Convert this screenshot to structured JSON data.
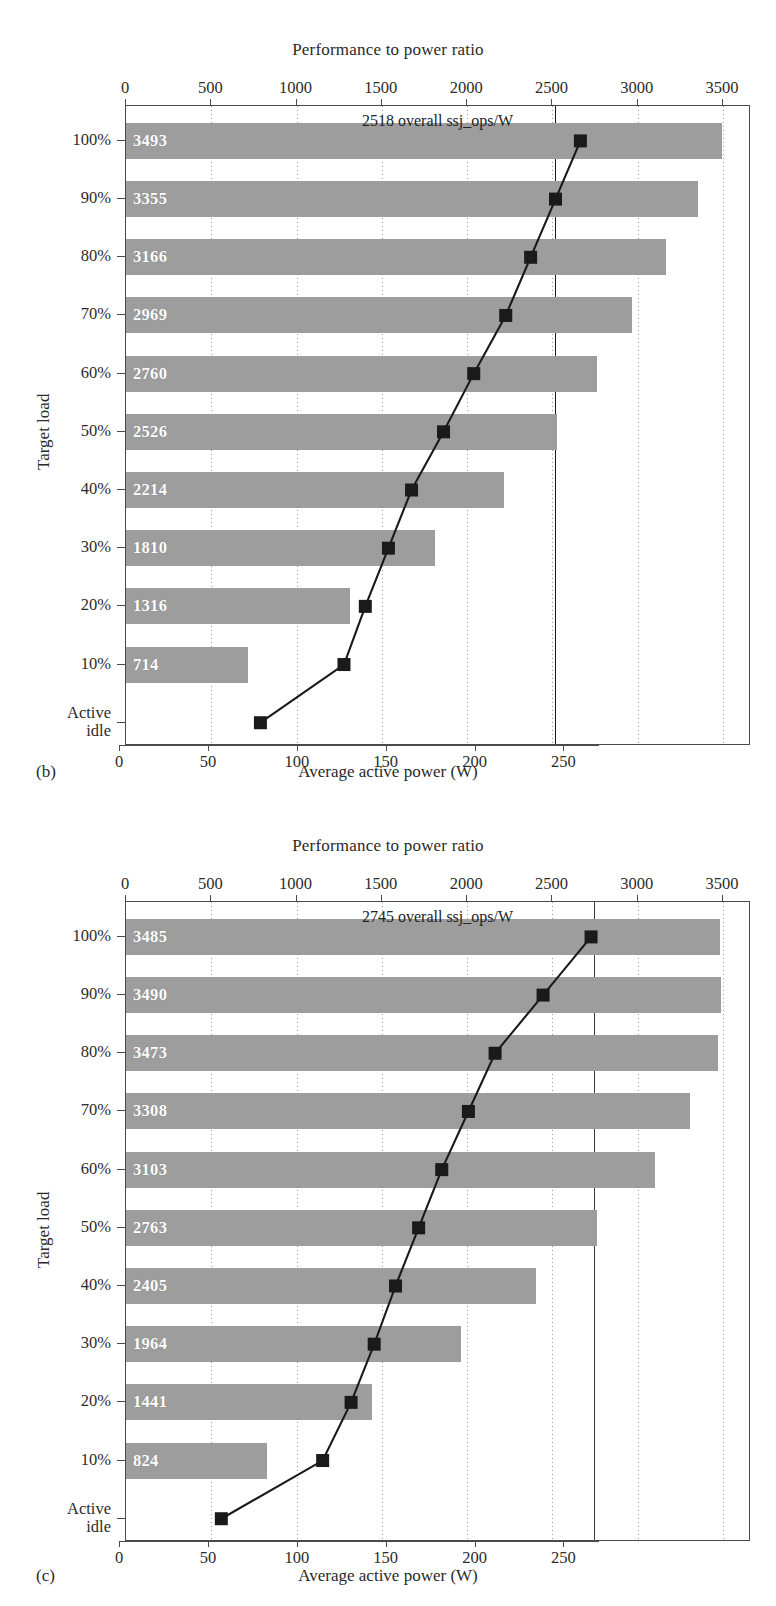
{
  "figure": {
    "panels": [
      {
        "letter": "(b)",
        "top_axis_title": "Performance to power ratio",
        "bottom_axis_title": "Average active power (W)",
        "y_axis_title": "Target load",
        "overall_label": "2518 overall ssj_ops/W",
        "chart_data": {
          "type": "bar",
          "title": "2518 overall ssj_ops/W",
          "xlabel": "Average active power (W)",
          "ylabel": "Target load",
          "top_xlabel": "Performance to power ratio",
          "grid": true,
          "legend": "none",
          "categories": [
            "100%",
            "90%",
            "80%",
            "70%",
            "60%",
            "50%",
            "40%",
            "30%",
            "20%",
            "10%",
            "Active idle"
          ],
          "top_axis": {
            "label": "Performance to power ratio",
            "ticks": [
              0,
              500,
              1000,
              1500,
              2000,
              2500,
              3000,
              3500
            ],
            "range": [
              0,
              3500
            ]
          },
          "bottom_axis": {
            "label": "Average active power (W)",
            "ticks": [
              0,
              50,
              100,
              150,
              200,
              250
            ],
            "range": [
              0,
              270
            ]
          },
          "series": [
            {
              "name": "Performance to power ratio (ssj_ops/W)",
              "type": "bar",
              "values": [
                3493,
                3355,
                3166,
                2969,
                2760,
                2526,
                2214,
                1810,
                1316,
                714,
                null
              ]
            },
            {
              "name": "Average active power (W)",
              "type": "line",
              "values": [
                259,
                245,
                231,
                217,
                199,
                182,
                164,
                151,
                138,
                126,
                79
              ]
            }
          ],
          "overall_ratio": 2518,
          "overall_units": "ssj_ops/W"
        }
      },
      {
        "letter": "(c)",
        "top_axis_title": "Performance to power ratio",
        "bottom_axis_title": "Average active power (W)",
        "y_axis_title": "Target load",
        "overall_label": "2745 overall ssj_ops/W",
        "chart_data": {
          "type": "bar",
          "title": "2745 overall ssj_ops/W",
          "xlabel": "Average active power (W)",
          "ylabel": "Target load",
          "top_xlabel": "Performance to power ratio",
          "grid": true,
          "legend": "none",
          "categories": [
            "100%",
            "90%",
            "80%",
            "70%",
            "60%",
            "50%",
            "40%",
            "30%",
            "20%",
            "10%",
            "Active idle"
          ],
          "top_axis": {
            "label": "Performance to power ratio",
            "ticks": [
              0,
              500,
              1000,
              1500,
              2000,
              2500,
              3000,
              3500
            ],
            "range": [
              0,
              3500
            ]
          },
          "bottom_axis": {
            "label": "Average active power (W)",
            "ticks": [
              0,
              50,
              100,
              150,
              200,
              250
            ],
            "range": [
              0,
              270
            ]
          },
          "series": [
            {
              "name": "Performance to power ratio (ssj_ops/W)",
              "type": "bar",
              "values": [
                3485,
                3490,
                3473,
                3308,
                3103,
                2763,
                2405,
                1964,
                1441,
                824,
                null
              ]
            },
            {
              "name": "Average active power (W)",
              "type": "line",
              "values": [
                265,
                238,
                211,
                196,
                181,
                168,
                155,
                143,
                130,
                114,
                57
              ]
            }
          ],
          "overall_ratio": 2745,
          "overall_units": "ssj_ops/W"
        }
      }
    ],
    "y_tick_labels": [
      "100%",
      "90%",
      "80%",
      "70%",
      "60%",
      "50%",
      "40%",
      "30%",
      "20%",
      "10%",
      "Active|idle"
    ],
    "colors": {
      "bar": "#a8a8a8",
      "marker": "#1a1a1a",
      "overall_line": "#1b1b1b",
      "axis": "#4a4a4a",
      "text": "#2a2a2a",
      "bar_label": "#ffffff"
    }
  }
}
